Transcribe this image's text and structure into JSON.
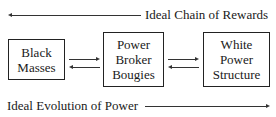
{
  "top_arrow": {
    "label": "Ideal Chain of Rewards",
    "direction": "left"
  },
  "bottom_arrow": {
    "label": "Ideal Evolution of Power",
    "direction": "right"
  },
  "boxes": [
    {
      "lines": [
        "Black",
        "Masses"
      ]
    },
    {
      "lines": [
        "Power",
        "Broker",
        "Bougies"
      ]
    },
    {
      "lines": [
        "White",
        "Power",
        "Structure"
      ]
    }
  ],
  "connectors": [
    {
      "from": "Black Masses",
      "to": "Power Broker Bougies",
      "bidirectional": true
    },
    {
      "from": "Power Broker Bougies",
      "to": "White Power Structure",
      "bidirectional": true
    }
  ]
}
